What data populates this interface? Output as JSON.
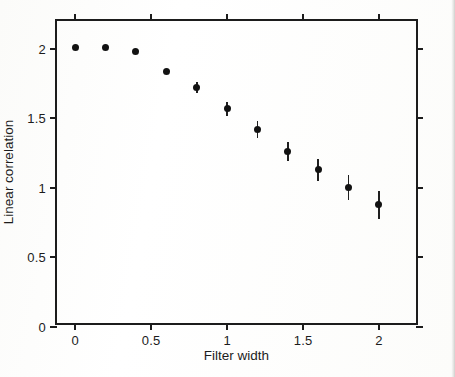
{
  "figure": {
    "background_color": "#ffffff",
    "axis_color": "#1c1c1c",
    "marker_color": "#121212"
  },
  "chart_data": {
    "type": "scatter",
    "title": "",
    "xlabel": "Filter width",
    "ylabel": "Linear correlation",
    "xlim": [
      -0.12,
      2.27
    ],
    "ylim": [
      0,
      2.2
    ],
    "xticks": [
      0,
      0.5,
      1,
      1.5,
      2
    ],
    "xtick_labels": [
      "0",
      "0.5",
      "1",
      "1.5",
      "2"
    ],
    "yticks": [
      0,
      0.5,
      1,
      1.5,
      2
    ],
    "ytick_labels": [
      "0",
      "0.5",
      "1",
      "1.5",
      "2"
    ],
    "grid": false,
    "legend": "none",
    "marker": "filled-circle",
    "errorbars": true,
    "x": [
      0.0,
      0.2,
      0.4,
      0.6,
      0.8,
      1.0,
      1.2,
      1.4,
      1.6,
      1.8,
      2.0
    ],
    "y": [
      2.01,
      2.01,
      1.98,
      1.84,
      1.72,
      1.57,
      1.42,
      1.26,
      1.13,
      1.0,
      0.88
    ],
    "yerr": [
      0.0,
      0.0,
      0.0,
      0.01,
      0.04,
      0.05,
      0.06,
      0.07,
      0.08,
      0.09,
      0.1
    ],
    "series_name": "linear correlation"
  },
  "footer": {
    "scrap_text": ""
  }
}
